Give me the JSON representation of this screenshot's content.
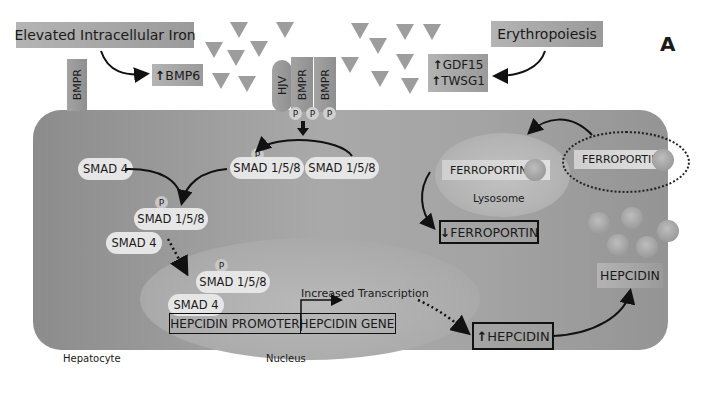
{
  "panel_label": "A",
  "inputs": {
    "iron": "Elevated Intracellular Iron",
    "erythropoiesis": "Erythropoiesis"
  },
  "signals": {
    "bmp6": "BMP6",
    "gdf15": "GDF15",
    "twsg1": "TWSG1",
    "up_arrow": "↑",
    "down_arrow": "↓"
  },
  "receptors": {
    "bmpr_left": "BMPR",
    "hjv": "HJV",
    "bmpr_1": "BMPR",
    "bmpr_2": "BMPR",
    "p": "P"
  },
  "smads": {
    "smad4_top": "SMAD 4",
    "smad158_phos": "SMAD 1/5/8",
    "smad158_unphos": "SMAD 1/5/8",
    "complex_smad158": "SMAD 1/5/8",
    "complex_smad4": "SMAD 4",
    "nuclear_smad158": "SMAD 1/5/8",
    "nuclear_smad4": "SMAD 4",
    "p": "P"
  },
  "gene": {
    "promoter": "HEPCIDIN PROMOTER",
    "gene": "HEPCIDIN GENE",
    "transcription": "Increased Transcription"
  },
  "ferroportin": {
    "lysosomal": "FERROPORTIN",
    "membrane": "FERROPORTIN",
    "decreased": "FERROPORTIN",
    "lysosome_label": "Lysosome"
  },
  "hepcidin": {
    "intracellular": "HEPCIDIN",
    "secreted": "HEPCIDIN"
  },
  "compartments": {
    "cell": "Hepatocyte",
    "nucleus": "Nucleus"
  }
}
